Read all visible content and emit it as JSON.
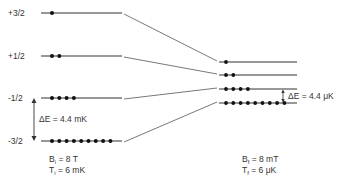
{
  "diagram": {
    "left_levels": [
      {
        "label": "+3/2",
        "y": 13,
        "population": 1
      },
      {
        "label": "+1/2",
        "y": 56,
        "population": 2
      },
      {
        "label": "-1/2",
        "y": 98,
        "population": 4
      },
      {
        "label": "-3/2",
        "y": 141,
        "population": 9
      }
    ],
    "right_levels": [
      {
        "y": 62,
        "population": 1
      },
      {
        "y": 75,
        "population": 2
      },
      {
        "y": 89,
        "population": 4
      },
      {
        "y": 103,
        "population": 9
      }
    ],
    "left_gap_label": "ΔE = 4.4 mK",
    "right_gap_label": "ΔE = 4.4 μK",
    "initial": {
      "B_symbol": "B",
      "B_sub": "i",
      "B_value": " = 8 T",
      "T_symbol": "T",
      "T_sub": "i",
      "T_value": " = 6 mK"
    },
    "final": {
      "B_symbol": "B",
      "B_sub": "f",
      "B_value": " = 8 mT",
      "T_symbol": "T",
      "T_sub": "f",
      "T_value": " = 6 μK"
    },
    "colors": {
      "line": "#333333",
      "dot": "#111111",
      "connector": "#555555"
    }
  }
}
